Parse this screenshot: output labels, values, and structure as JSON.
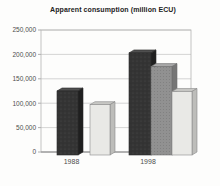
{
  "chart_data": {
    "type": "bar",
    "title": "Apparent consumption (million ECU)",
    "categories": [
      "1988",
      "1998"
    ],
    "series": [
      {
        "name": "dark-series",
        "color": "#343434",
        "values": [
          125000,
          203000
        ]
      },
      {
        "name": "medium-series",
        "color": "#919191",
        "values": [
          null,
          175000
        ]
      },
      {
        "name": "light-series",
        "color": "#e9e9e6",
        "values": [
          97000,
          124000
        ]
      }
    ],
    "xlabel": "",
    "ylabel": "",
    "ylim": [
      0,
      250000
    ],
    "ytick_step": 50000,
    "ytick_labels": [
      "0",
      "50,000",
      "100,000",
      "150,000",
      "200,000",
      "250,000"
    ],
    "grid": true,
    "legend": "none",
    "style": "pseudo-3d-columns",
    "colors": {
      "gridline": "#c9c9c9",
      "plot_border": "#b5b5b5",
      "baseline": "#909090",
      "tick_text": "#4d4d4d"
    }
  }
}
